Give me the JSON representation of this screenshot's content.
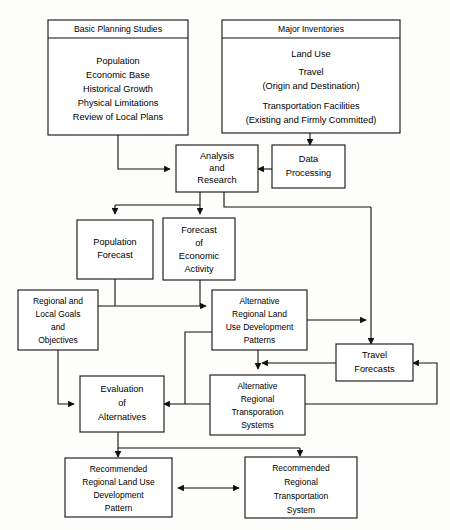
{
  "diagram": {
    "type": "flowchart",
    "stroke_color": "#111111",
    "box_fill": "#ffffff",
    "background": "#fdfdfb"
  },
  "nodes": {
    "basic_planning_studies": {
      "header": "Basic Planning Studies",
      "lines": [
        "Population",
        "Economic Base",
        "Historical Growth",
        "Physical Limitations",
        "Review of Local Plans"
      ]
    },
    "major_inventories": {
      "header": "Major Inventories",
      "lines": [
        "Land Use",
        "Travel",
        "(Origin and Destination)",
        "Transportation Facilities",
        "(Existing and Firmly Committed)"
      ]
    },
    "analysis_and_research": {
      "lines": [
        "Analysis",
        "and",
        "Research"
      ]
    },
    "data_processing": {
      "lines": [
        "Data",
        "Processing"
      ]
    },
    "population_forecast": {
      "lines": [
        "Population",
        "Forecast"
      ]
    },
    "forecast_economic_activity": {
      "lines": [
        "Forecast",
        "of",
        "Economic",
        "Activity"
      ]
    },
    "regional_local_goals": {
      "lines": [
        "Regional and",
        "Local Goals",
        "and",
        "Objectives"
      ]
    },
    "alt_land_use_patterns": {
      "lines": [
        "Alternative",
        "Regional Land",
        "Use Development",
        "Patterns"
      ]
    },
    "travel_forecasts": {
      "lines": [
        "Travel",
        "Forecasts"
      ]
    },
    "evaluation_of_alternatives": {
      "lines": [
        "Evaluation",
        "of",
        "Alternatives"
      ]
    },
    "alt_transportation_systems": {
      "lines": [
        "Alternative",
        "Regional",
        "Transporation",
        "Systems"
      ]
    },
    "recommended_land_use": {
      "lines": [
        "Recommended",
        "Regional Land Use",
        "Development",
        "Pattern"
      ]
    },
    "recommended_transportation": {
      "lines": [
        "Recommended",
        "Regional",
        "Transportation",
        "System"
      ]
    }
  }
}
